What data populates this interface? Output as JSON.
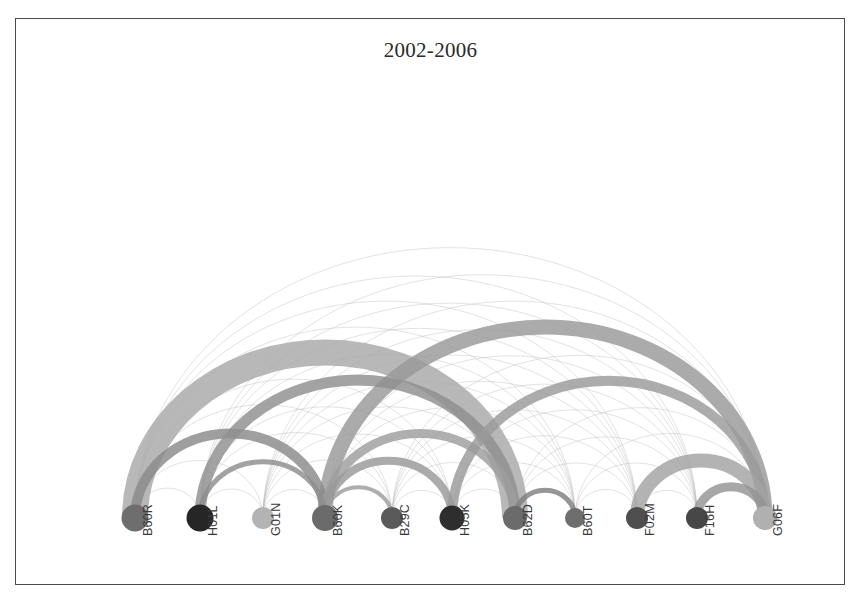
{
  "figure": {
    "title": "2002-2006",
    "background_color": "#ffffff",
    "border_color": "#4a4a4a",
    "frame": {
      "x": 15,
      "y": 18,
      "width": 830,
      "height": 567
    }
  },
  "chart_data": {
    "type": "arc_diagram",
    "title": "2002-2006",
    "xlabel": "",
    "ylabel": "",
    "baseline_y": 518,
    "grid": false,
    "legend_position": "none",
    "nodes": [
      {
        "id": "B60R",
        "label": "B60R",
        "x": 135,
        "radius": 13.5,
        "color": "#6e6e6e"
      },
      {
        "id": "H01L",
        "label": "H01L",
        "x": 200,
        "radius": 13.5,
        "color": "#262626"
      },
      {
        "id": "G01N",
        "label": "G01N",
        "x": 263,
        "radius": 11.0,
        "color": "#b3b3b3"
      },
      {
        "id": "B60K",
        "label": "B60K",
        "x": 325,
        "radius": 13.0,
        "color": "#6b6b6b"
      },
      {
        "id": "B29C",
        "label": "B29C",
        "x": 392,
        "radius": 11.0,
        "color": "#5a5a5a"
      },
      {
        "id": "H05K",
        "label": "H05K",
        "x": 452,
        "radius": 12.5,
        "color": "#2e2e2e"
      },
      {
        "id": "B62D",
        "label": "B62D",
        "x": 515,
        "radius": 12.0,
        "color": "#6b6b6b"
      },
      {
        "id": "B60T",
        "label": "B60T",
        "x": 575,
        "radius": 10.0,
        "color": "#6e6e6e"
      },
      {
        "id": "F02M",
        "label": "F02M",
        "x": 637,
        "radius": 11.0,
        "color": "#4f4f4f"
      },
      {
        "id": "F16H",
        "label": "F16H",
        "x": 697,
        "radius": 11.0,
        "color": "#474747"
      },
      {
        "id": "G06F",
        "label": "G06F",
        "x": 765,
        "radius": 12.0,
        "color": "#b0b0b0"
      }
    ],
    "major_links": [
      {
        "source": "B60R",
        "target": "B62D",
        "weight": 26,
        "color": "#a8a8a8"
      },
      {
        "source": "B60K",
        "target": "G06F",
        "weight": 15,
        "color": "#999999"
      },
      {
        "source": "B60R",
        "target": "B60K",
        "weight": 10,
        "color": "#8a8a8a"
      },
      {
        "source": "H01L",
        "target": "B62D",
        "weight": 11,
        "color": "#8f8f8f"
      },
      {
        "source": "B60K",
        "target": "B62D",
        "weight": 9,
        "color": "#9e9e9e"
      },
      {
        "source": "B60K",
        "target": "H05K",
        "weight": 8,
        "color": "#989898"
      },
      {
        "source": "H05K",
        "target": "G06F",
        "weight": 10,
        "color": "#9a9a9a"
      },
      {
        "source": "F02M",
        "target": "G06F",
        "weight": 14,
        "color": "#a2a2a2"
      },
      {
        "source": "F16H",
        "target": "G06F",
        "weight": 9,
        "color": "#949494"
      },
      {
        "source": "B62D",
        "target": "B60T",
        "weight": 5,
        "color": "#7f7f7f"
      },
      {
        "source": "B60K",
        "target": "B29C",
        "weight": 4,
        "color": "#9c9c9c"
      },
      {
        "source": "H01L",
        "target": "B60K",
        "weight": 5,
        "color": "#8d8d8d"
      }
    ],
    "minor_links": [
      {
        "source": "B60R",
        "target": "H01L",
        "weight": 1
      },
      {
        "source": "B60R",
        "target": "G01N",
        "weight": 1
      },
      {
        "source": "B60R",
        "target": "B29C",
        "weight": 1
      },
      {
        "source": "B60R",
        "target": "H05K",
        "weight": 1
      },
      {
        "source": "B60R",
        "target": "B60T",
        "weight": 1
      },
      {
        "source": "B60R",
        "target": "F02M",
        "weight": 1
      },
      {
        "source": "B60R",
        "target": "F16H",
        "weight": 1
      },
      {
        "source": "B60R",
        "target": "G06F",
        "weight": 1
      },
      {
        "source": "H01L",
        "target": "G01N",
        "weight": 1
      },
      {
        "source": "H01L",
        "target": "B29C",
        "weight": 1
      },
      {
        "source": "H01L",
        "target": "H05K",
        "weight": 1
      },
      {
        "source": "H01L",
        "target": "B60T",
        "weight": 1
      },
      {
        "source": "H01L",
        "target": "F02M",
        "weight": 1
      },
      {
        "source": "H01L",
        "target": "F16H",
        "weight": 1
      },
      {
        "source": "H01L",
        "target": "G06F",
        "weight": 1
      },
      {
        "source": "G01N",
        "target": "B60K",
        "weight": 1
      },
      {
        "source": "G01N",
        "target": "B29C",
        "weight": 1
      },
      {
        "source": "G01N",
        "target": "H05K",
        "weight": 1
      },
      {
        "source": "G01N",
        "target": "B62D",
        "weight": 1
      },
      {
        "source": "G01N",
        "target": "B60T",
        "weight": 1
      },
      {
        "source": "G01N",
        "target": "F02M",
        "weight": 1
      },
      {
        "source": "G01N",
        "target": "F16H",
        "weight": 1
      },
      {
        "source": "G01N",
        "target": "G06F",
        "weight": 1
      },
      {
        "source": "B60K",
        "target": "B60T",
        "weight": 1
      },
      {
        "source": "B60K",
        "target": "F02M",
        "weight": 1
      },
      {
        "source": "B60K",
        "target": "F16H",
        "weight": 1
      },
      {
        "source": "B29C",
        "target": "H05K",
        "weight": 1
      },
      {
        "source": "B29C",
        "target": "B62D",
        "weight": 1
      },
      {
        "source": "B29C",
        "target": "B60T",
        "weight": 1
      },
      {
        "source": "B29C",
        "target": "F02M",
        "weight": 1
      },
      {
        "source": "B29C",
        "target": "F16H",
        "weight": 1
      },
      {
        "source": "B29C",
        "target": "G06F",
        "weight": 1
      },
      {
        "source": "H05K",
        "target": "B62D",
        "weight": 1
      },
      {
        "source": "H05K",
        "target": "B60T",
        "weight": 1
      },
      {
        "source": "H05K",
        "target": "F02M",
        "weight": 1
      },
      {
        "source": "H05K",
        "target": "F16H",
        "weight": 1
      },
      {
        "source": "B62D",
        "target": "F02M",
        "weight": 1
      },
      {
        "source": "B62D",
        "target": "F16H",
        "weight": 1
      },
      {
        "source": "B62D",
        "target": "G06F",
        "weight": 1
      },
      {
        "source": "B60T",
        "target": "F02M",
        "weight": 1
      },
      {
        "source": "B60T",
        "target": "F16H",
        "weight": 1
      },
      {
        "source": "B60T",
        "target": "G06F",
        "weight": 1
      },
      {
        "source": "F02M",
        "target": "F16H",
        "weight": 1
      }
    ]
  }
}
